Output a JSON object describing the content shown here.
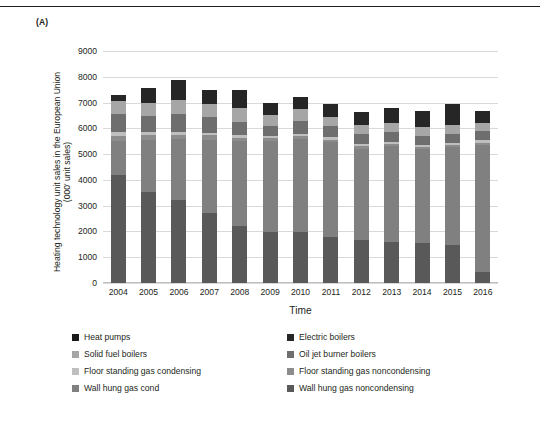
{
  "figure": {
    "panel_label": "(A)",
    "y_axis_title_line1": "Heating technology unit sales in the European Union",
    "y_axis_title_line2": "(000' unit sales)",
    "x_axis_title": "Time"
  },
  "chart_data": {
    "type": "bar",
    "stacked": true,
    "title": "",
    "xlabel": "Time",
    "ylabel": "Heating technology unit sales in the European Union (000' unit sales)",
    "ylim": [
      0,
      9000
    ],
    "yticks": [
      0,
      1000,
      2000,
      3000,
      4000,
      5000,
      6000,
      7000,
      8000,
      9000
    ],
    "grid": true,
    "legend_position": "bottom",
    "categories": [
      "2004",
      "2005",
      "2006",
      "2007",
      "2008",
      "2009",
      "2010",
      "2011",
      "2012",
      "2013",
      "2014",
      "2015",
      "2016"
    ],
    "series": [
      {
        "name": "Wall hung gas noncondensing",
        "color": "#595959",
        "values": [
          4180,
          3520,
          3230,
          2730,
          2220,
          1960,
          1980,
          1800,
          1680,
          1580,
          1560,
          1480,
          440
        ]
      },
      {
        "name": "Wall hung gas cond",
        "color": "#808080",
        "values": [
          1330,
          2030,
          2340,
          2830,
          3290,
          3540,
          3620,
          3660,
          3530,
          3720,
          3620,
          3800,
          4930
        ]
      },
      {
        "name": "Floor standing gas noncondensing",
        "color": "#8c8c8c",
        "values": [
          190,
          180,
          170,
          170,
          120,
          110,
          110,
          100,
          100,
          90,
          90,
          80,
          80
        ]
      },
      {
        "name": "Floor standing gas condensing",
        "color": "#bfbfbf",
        "values": [
          140,
          130,
          120,
          110,
          100,
          90,
          90,
          90,
          90,
          90,
          90,
          90,
          90
        ]
      },
      {
        "name": "Oil jet burner boilers",
        "color": "#6e6e6e",
        "values": [
          700,
          620,
          680,
          600,
          510,
          410,
          490,
          430,
          380,
          380,
          360,
          350,
          340
        ]
      },
      {
        "name": "Solid fuel boilers",
        "color": "#a6a6a6",
        "values": [
          510,
          500,
          560,
          520,
          560,
          420,
          450,
          370,
          360,
          360,
          320,
          330,
          320
        ]
      },
      {
        "name": "Electric boilers",
        "color": "#262626",
        "values": [
          230,
          600,
          760,
          540,
          690,
          460,
          480,
          500,
          500,
          590,
          630,
          810,
          480
        ]
      },
      {
        "name": "Heat pumps",
        "color": "#1a1a1a",
        "values": [
          0,
          0,
          0,
          0,
          0,
          0,
          0,
          0,
          0,
          0,
          0,
          0,
          0
        ]
      }
    ],
    "totals": [
      7280,
      7580,
      7860,
      7500,
      7490,
      6990,
      7220,
      6950,
      6640,
      6810,
      6670,
      6940,
      6680
    ]
  },
  "legend": {
    "items": [
      {
        "label": "Heat pumps",
        "color": "#1a1a1a"
      },
      {
        "label": "Electric boilers",
        "color": "#262626"
      },
      {
        "label": "Solid fuel boilers",
        "color": "#a6a6a6"
      },
      {
        "label": "Oil jet burner boilers",
        "color": "#6e6e6e"
      },
      {
        "label": "Floor standing gas condensing",
        "color": "#bfbfbf"
      },
      {
        "label": "Floor standing gas noncondensing",
        "color": "#8c8c8c"
      },
      {
        "label": "Wall hung gas cond",
        "color": "#808080"
      },
      {
        "label": "Wall hung gas noncondensing",
        "color": "#595959"
      }
    ]
  }
}
